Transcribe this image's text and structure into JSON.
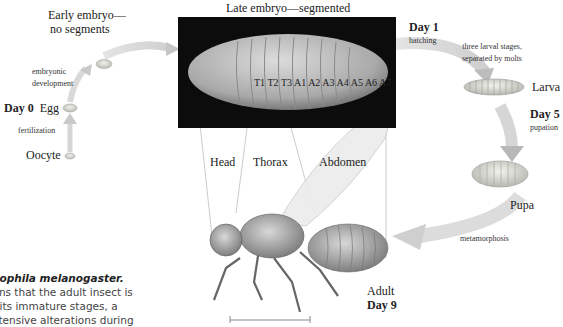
{
  "diagram": {
    "stages": {
      "oocyte": "Oocyte",
      "egg_day": "Day 0",
      "egg": "Egg",
      "early_embryo": [
        "Early embryo—",
        "no segments"
      ],
      "late_embryo": "Late embryo—segmented",
      "larva": "Larva",
      "pupa": "Pupa",
      "adult": "Adult"
    },
    "transitions": {
      "fertilization": "fertilization",
      "embryonic_development": [
        "embryonic",
        "development"
      ],
      "hatching_day": "Day 1",
      "hatching": "hatching",
      "larval_stages": [
        "three larval stages,",
        "separated by molts"
      ],
      "pupation_day": "Day 5",
      "pupation": "pupation",
      "metamorphosis": "metamorphosis",
      "adult_day": "Day 9"
    },
    "segments": [
      "T1",
      "T2",
      "T3",
      "A1",
      "A2",
      "A3",
      "A4",
      "A5",
      "A6",
      "A7"
    ],
    "body_regions": {
      "head": "Head",
      "thorax": "Thorax",
      "abdomen": "Abdomen"
    },
    "caption": {
      "title": "osophila melanogaster.",
      "lines": [
        "eans that the adult insect is",
        "m its immature stages, a",
        "extensive alterations during"
      ]
    },
    "colors": {
      "arrow": "#d8d8d8",
      "embryo_bg": "#0c0c0c",
      "embryo": "#b8b8b8",
      "larva": "#c8c8c0",
      "pupa": "#d0d0cc",
      "fly": "#9a9a9a"
    }
  }
}
